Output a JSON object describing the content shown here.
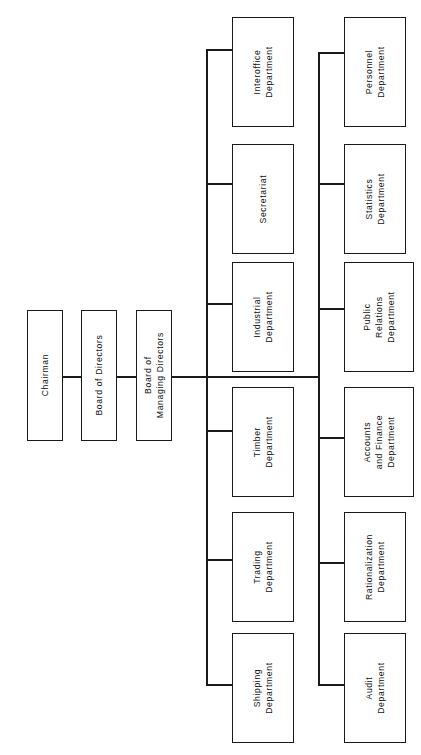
{
  "chart_title": "Company Organization Chart",
  "orientation": "rotated-90-ccw",
  "spine": {
    "chairman": "Chairman",
    "board_of_directors": "Board of Directors",
    "board_of_managing_directors_line1": "Board of",
    "board_of_managing_directors_line2": "Managing Directors"
  },
  "branch_upper": {
    "name": "upper-branch",
    "departments": [
      {
        "line1": "Interoffice",
        "line2": "Department"
      },
      {
        "line1": "Secretariat",
        "line2": ""
      },
      {
        "line1": "Industrial",
        "line2": "Department"
      },
      {
        "line1": "Timber",
        "line2": "Department"
      },
      {
        "line1": "Trading",
        "line2": "Department"
      },
      {
        "line1": "Shipping",
        "line2": "Department"
      }
    ]
  },
  "branch_lower": {
    "name": "lower-branch",
    "departments": [
      {
        "line1": "Personnel",
        "line2": "Department",
        "line3": ""
      },
      {
        "line1": "Statistics",
        "line2": "Department",
        "line3": ""
      },
      {
        "line1": "Public",
        "line2": "Relations",
        "line3": "Department"
      },
      {
        "line1": "Accounts",
        "line2": "and Finance",
        "line3": "Department"
      },
      {
        "line1": "Rationalization",
        "line2": "Department",
        "line3": ""
      },
      {
        "line1": "Audit",
        "line2": "Department",
        "line3": ""
      }
    ]
  },
  "colors": {
    "line": "#1a1a1a",
    "box_border": "#1a1a1a",
    "box_fill": "#ffffff",
    "text": "#111111",
    "background": "#ffffff"
  }
}
